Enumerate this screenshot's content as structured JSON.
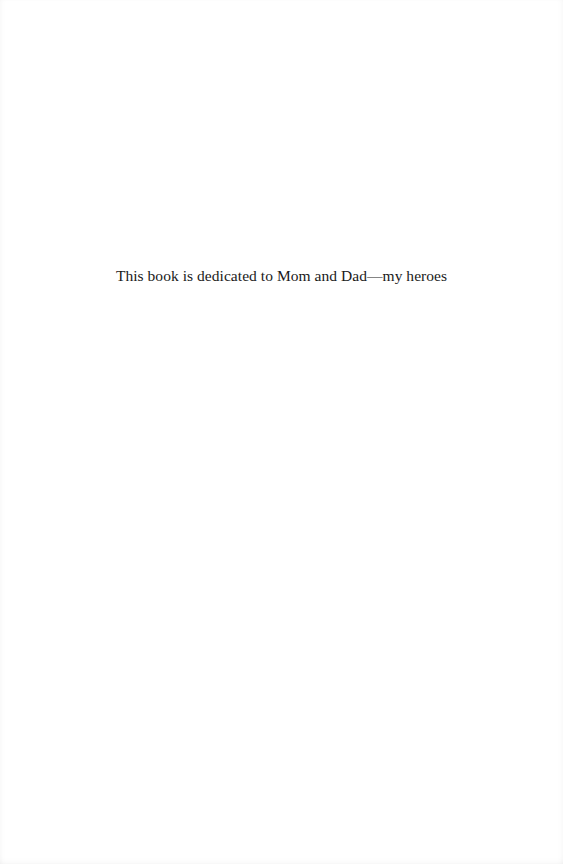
{
  "page": {
    "dedication": "This book is dedicated to Mom and Dad—my heroes"
  },
  "colors": {
    "background": "#ffffff",
    "text": "#1a1a1a"
  }
}
